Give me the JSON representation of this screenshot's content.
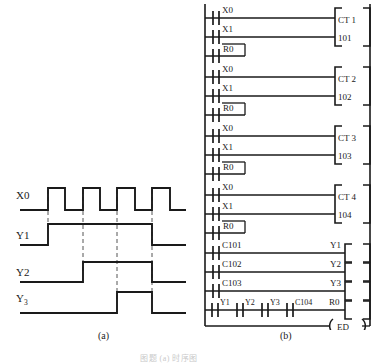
{
  "figure": {
    "caption_a": "(a)",
    "caption_b": "(b)",
    "caption_bottom": "图题 (a) 时序图"
  },
  "timing_diagram": {
    "signals": [
      {
        "name": "X0",
        "label": "X0",
        "subscript": ""
      },
      {
        "name": "Y1",
        "label": "Y1",
        "subscript": ""
      },
      {
        "name": "Y2",
        "label": "Y2",
        "subscript": ""
      },
      {
        "name": "Y3",
        "label": "Y",
        "subscript": "3"
      }
    ],
    "dashed_marker_count": 4,
    "pulse_count": 4
  },
  "ladder_diagram": {
    "rungs": [
      {
        "id": "rung-ct1",
        "contacts": [
          {
            "label": "X0",
            "type": "no"
          },
          {
            "label": "X1",
            "type": "no"
          },
          {
            "label": "R0",
            "type": "no"
          }
        ],
        "block": {
          "line1": "CT  1",
          "line2": "101"
        }
      },
      {
        "id": "rung-ct2",
        "contacts": [
          {
            "label": "X0",
            "type": "no"
          },
          {
            "label": "X1",
            "type": "no"
          },
          {
            "label": "R0",
            "type": "no"
          }
        ],
        "block": {
          "line1": "CT  2",
          "line2": "102"
        }
      },
      {
        "id": "rung-ct3",
        "contacts": [
          {
            "label": "X0",
            "type": "no"
          },
          {
            "label": "X1",
            "type": "no"
          },
          {
            "label": "R0",
            "type": "no"
          }
        ],
        "block": {
          "line1": "CT  3",
          "line2": "103"
        }
      },
      {
        "id": "rung-ct4",
        "contacts": [
          {
            "label": "X0",
            "type": "no"
          },
          {
            "label": "X1",
            "type": "no"
          },
          {
            "label": "R0",
            "type": "no"
          }
        ],
        "block": {
          "line1": "CT  4",
          "line2": "104"
        }
      }
    ],
    "coil_rungs": [
      {
        "id": "rung-y1",
        "contacts": [
          "C101"
        ],
        "coil": "Y1"
      },
      {
        "id": "rung-y2",
        "contacts": [
          "C102"
        ],
        "coil": "Y2"
      },
      {
        "id": "rung-y3",
        "contacts": [
          "C103"
        ],
        "coil": "Y3"
      },
      {
        "id": "rung-r0",
        "contacts": [
          "Y1",
          "Y2",
          "Y3",
          "C104"
        ],
        "coil": "R0"
      }
    ],
    "end_instruction": "ED"
  }
}
